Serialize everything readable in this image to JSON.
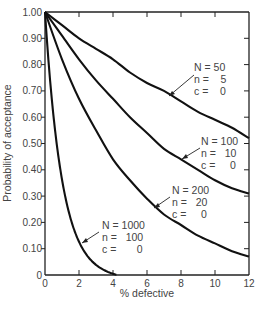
{
  "chart_data": {
    "type": "line",
    "title": "",
    "xlabel": "% defective",
    "ylabel": "Probability of acceptance",
    "xlim": [
      0,
      12
    ],
    "ylim": [
      0,
      1.0
    ],
    "grid": false,
    "legend": "inline annotations with arrows",
    "x_ticks": [
      "0",
      "2",
      "4",
      "6",
      "8",
      "10",
      "12"
    ],
    "y_ticks": [
      "0",
      "0.10",
      "0.20",
      "0.30",
      "0.40",
      "0.50",
      "0.60",
      "0.70",
      "0.80",
      "0.90",
      "1.00"
    ],
    "x": [
      0,
      1,
      2,
      3,
      4,
      5,
      6,
      7,
      8,
      9,
      10,
      11,
      12
    ],
    "series": [
      {
        "name": "N = 50, n = 5, c = 0",
        "N": 50,
        "n": 5,
        "c": 0,
        "values": [
          1.0,
          0.95,
          0.9,
          0.86,
          0.82,
          0.77,
          0.73,
          0.7,
          0.66,
          0.62,
          0.59,
          0.56,
          0.52
        ]
      },
      {
        "name": "N = 100, n = 10, c = 0",
        "N": 100,
        "n": 10,
        "c": 0,
        "values": [
          1.0,
          0.91,
          0.82,
          0.74,
          0.67,
          0.6,
          0.54,
          0.48,
          0.44,
          0.4,
          0.36,
          0.33,
          0.31
        ]
      },
      {
        "name": "N = 200, n = 20, c = 0",
        "N": 200,
        "n": 20,
        "c": 0,
        "values": [
          1.0,
          0.82,
          0.67,
          0.55,
          0.44,
          0.36,
          0.29,
          0.23,
          0.19,
          0.15,
          0.12,
          0.09,
          0.07
        ]
      },
      {
        "name": "N = 1000, n = 100, c = 0",
        "N": 1000,
        "n": 100,
        "c": 0,
        "values": [
          1.0,
          0.37,
          0.13,
          0.05,
          0.01,
          0.0,
          null,
          null,
          null,
          null,
          null,
          null,
          null
        ]
      }
    ]
  },
  "axes": {
    "xlabel": "% defective",
    "ylabel": "Probability of acceptance"
  },
  "annotations": [
    {
      "N": "N = 50",
      "n": "n =    5",
      "c": "c =    0"
    },
    {
      "N": "N = 100",
      "n": "n =   10",
      "c": "c =     0"
    },
    {
      "N": "N = 200",
      "n": "n =   20",
      "c": "c =     0"
    },
    {
      "N": "N = 1000",
      "n": "n =   100",
      "c": "c =       0"
    }
  ]
}
